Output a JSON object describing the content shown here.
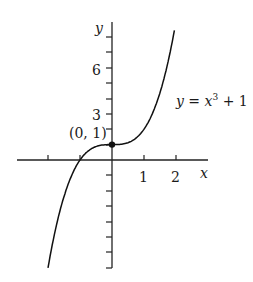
{
  "chart_data": {
    "type": "line",
    "title": "",
    "xlabel": "x",
    "ylabel": "y",
    "xlim": [
      -3,
      3
    ],
    "ylim": [
      -8,
      8
    ],
    "x_ticks": [
      -2,
      -1,
      1,
      2
    ],
    "x_tick_labels": [
      "",
      "",
      "1",
      "2"
    ],
    "y_ticks": [
      -7,
      -6,
      -5,
      -4,
      -3,
      -2,
      -1,
      1,
      2,
      3,
      4,
      5,
      6,
      7,
      8
    ],
    "y_tick_labels": {
      "3": "3",
      "6": "6",
      "1": "(0, 1)"
    },
    "grid": false,
    "series": [
      {
        "name": "y = x^3 + 1",
        "function": "x^3 + 1",
        "x_range": [
          -2.0,
          1.95
        ]
      }
    ],
    "annotations": [
      {
        "text": "y = x³ + 1",
        "x": 2.6,
        "y": 3
      },
      {
        "text": "(0, 1)",
        "point": [
          0,
          1
        ],
        "marker": "filled-circle"
      }
    ]
  },
  "labels": {
    "x_axis": "x",
    "y_axis": "y",
    "tick_1": "1",
    "tick_2": "2",
    "tick_3": "3",
    "tick_6": "6",
    "point": "(0, 1)",
    "equation_y": "y",
    "equation_eq": " = ",
    "equation_x": "x",
    "equation_exp": "3",
    "equation_tail": " + 1"
  }
}
